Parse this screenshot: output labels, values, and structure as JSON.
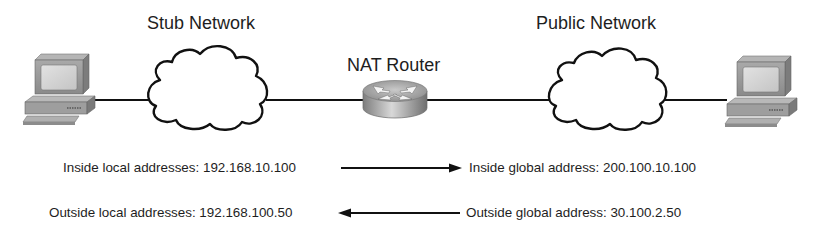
{
  "diagram": {
    "labels": {
      "stub_network": "Stub Network",
      "nat_router": "NAT Router",
      "public_network": "Public Network"
    },
    "nodes": [
      {
        "id": "inside-host",
        "type": "pc-icon"
      },
      {
        "id": "stub-network",
        "type": "cloud-icon",
        "label": "Stub Network"
      },
      {
        "id": "nat-router",
        "type": "router-icon",
        "label": "NAT Router"
      },
      {
        "id": "public-network",
        "type": "cloud-icon",
        "label": "Public Network"
      },
      {
        "id": "outside-host",
        "type": "pc-icon"
      }
    ],
    "mappings": [
      {
        "from": "Inside local addresses: 192.168.10.100",
        "to": "Inside global address: 200.100.10.100",
        "direction": "right"
      },
      {
        "from": "Outside global address: 30.100.2.50",
        "to": "Outside local addresses: 192.168.100.50",
        "direction": "left"
      }
    ],
    "address_text": {
      "inside_local": "Inside local addresses: 192.168.10.100",
      "inside_global": "Inside global address: 200.100.10.100",
      "outside_local": "Outside local addresses: 192.168.100.50",
      "outside_global": "Outside global address: 30.100.2.50"
    },
    "colors": {
      "line": "#111111",
      "cloud_fill": "#ffffff",
      "pc_body": "#9a9a9a",
      "router_body": "#a8a8a8"
    }
  }
}
